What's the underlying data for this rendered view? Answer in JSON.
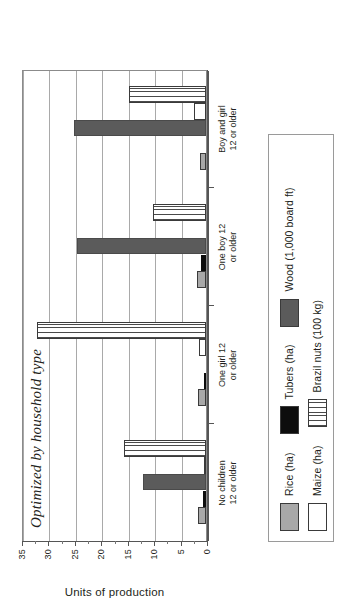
{
  "chart_data": {
    "type": "bar",
    "title": "Optimized by household type",
    "xlabel": "",
    "ylabel": "Units of production",
    "ylim": [
      0,
      35
    ],
    "yticks": [
      0,
      5,
      10,
      15,
      20,
      25,
      30,
      35
    ],
    "ytick_labels": [
      "0",
      "5",
      "10",
      "15",
      "20",
      "25",
      "30",
      "35"
    ],
    "grid": true,
    "legend_position": "below-plot",
    "orientation": "vertical-bars-rotated-page",
    "categories": [
      "No children\n12 or older",
      "One girl 12\nor older",
      "One boy 12\nor older",
      "Boy and girl\n12 or older"
    ],
    "series": [
      {
        "name": "Rice (ha)",
        "fill": "rice",
        "color": "#a8a8a8",
        "values": [
          1.5,
          1.5,
          1.8,
          1.2
        ]
      },
      {
        "name": "Tubers (ha)",
        "fill": "tubers",
        "color": "#0d0d0d",
        "values": [
          0.5,
          0.3,
          1.0,
          0.0
        ]
      },
      {
        "name": "Wood (1,000 board ft)",
        "fill": "wood",
        "color": "#5b5b5b",
        "values": [
          12.0,
          0.0,
          24.5,
          25.0
        ]
      },
      {
        "name": "Maize (ha)",
        "fill": "maize",
        "color": "#ffffff",
        "values": [
          0.3,
          1.3,
          0.0,
          2.2
        ]
      },
      {
        "name": "Brazil nuts (100 kg)",
        "fill": "brazil",
        "color": "#4a4a4a",
        "values": [
          15.5,
          32.0,
          10.0,
          14.5
        ]
      }
    ]
  },
  "legend": {
    "row1": [
      {
        "label": "Rice (ha)",
        "fill": "rice"
      },
      {
        "label": "Tubers (ha)",
        "fill": "tubers"
      },
      {
        "label": "Wood (1,000 board ft)",
        "fill": "wood"
      }
    ],
    "row2": [
      {
        "label": "Maize (ha)",
        "fill": "maize"
      },
      {
        "label": "Brazil nuts (100 kg)",
        "fill": "brazil"
      }
    ]
  }
}
